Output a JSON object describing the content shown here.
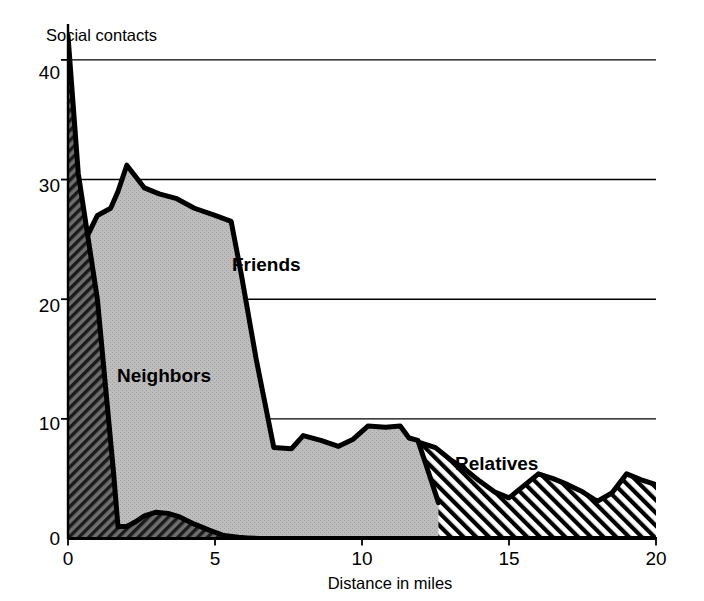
{
  "chart_data": {
    "type": "area",
    "title": "",
    "subtitle": "",
    "xlabel": "Distance in miles",
    "ylabel": "Social contacts",
    "xlim": [
      0,
      20
    ],
    "ylim": [
      0,
      43
    ],
    "xticks": [
      0,
      5,
      10,
      15,
      20
    ],
    "xtick_labels": [
      "0",
      "5",
      "10",
      "15",
      "20"
    ],
    "yticks": [
      0,
      10,
      20,
      30,
      40
    ],
    "ytick_labels": [
      "0",
      "10",
      "20",
      "30",
      "40"
    ],
    "grid": "horizontal",
    "gridlines_at": [
      10,
      20,
      30,
      40
    ],
    "legend": "inline-annotations",
    "stacked": false,
    "overlapping": true,
    "series": [
      {
        "name": "Neighbors",
        "fill": "dense-diagonal-hatch-dark",
        "fill_color": "#555555",
        "label_position": {
          "x": 2.0,
          "y": 15.0
        },
        "x": [
          0,
          0.35,
          1.0,
          1.55,
          1.7,
          2.0,
          2.3,
          2.6,
          3.0,
          3.4,
          3.8,
          4.3,
          4.8,
          5.3,
          5.8,
          6.1,
          6.5,
          7.0,
          20
        ],
        "values": [
          42.0,
          30.5,
          20.0,
          5.5,
          1.0,
          1.0,
          1.4,
          1.9,
          2.2,
          2.1,
          1.8,
          1.2,
          0.7,
          0.25,
          0.1,
          0.05,
          0.0,
          0.0,
          0.0
        ]
      },
      {
        "name": "Friends",
        "fill": "solid-light-gray",
        "fill_color": "#b9b9b9",
        "label_position": {
          "x": 6.0,
          "y": 24.0
        },
        "x": [
          0,
          0.4,
          1.0,
          1.45,
          1.7,
          2.0,
          2.6,
          3.1,
          3.7,
          4.3,
          5.0,
          5.55,
          5.9,
          6.4,
          7.0,
          7.6,
          8.0,
          8.6,
          9.2,
          9.7,
          10.2,
          10.8,
          11.3,
          11.6,
          11.9,
          12.2,
          12.6
        ],
        "values": [
          20.0,
          24.0,
          27.0,
          27.6,
          29.0,
          31.2,
          29.3,
          28.8,
          28.4,
          27.6,
          27.0,
          26.5,
          22.0,
          15.0,
          7.6,
          7.5,
          8.6,
          8.2,
          7.7,
          8.3,
          9.4,
          9.3,
          9.4,
          8.4,
          8.2,
          6.0,
          3.0
        ]
      },
      {
        "name": "Relatives",
        "fill": "diagonal-stripes-white",
        "fill_color": "#ffffff",
        "label_position": {
          "x": 14.6,
          "y": 6.6
        },
        "x": [
          0,
          0.5,
          1.0,
          1.6,
          2.0,
          2.5,
          3.0,
          3.5,
          4.0,
          4.5,
          5.0,
          5.5,
          6.0,
          6.5,
          7.0,
          7.5,
          8.0,
          8.5,
          9.0,
          9.5,
          10.0,
          10.5,
          11.0,
          11.5,
          12.0,
          12.5,
          13.0,
          13.5,
          14.0,
          14.5,
          15.0,
          15.5,
          16.0,
          16.5,
          17.0,
          17.5,
          18.0,
          18.5,
          19.0,
          19.5,
          20.0
        ],
        "values": [
          0.0,
          3.5,
          5.4,
          5.5,
          5.5,
          4.6,
          4.0,
          4.6,
          5.3,
          6.0,
          6.5,
          5.7,
          5.0,
          4.5,
          4.4,
          4.4,
          4.4,
          5.1,
          5.2,
          4.7,
          4.6,
          5.2,
          6.0,
          6.6,
          8.0,
          7.6,
          6.6,
          5.8,
          4.8,
          3.9,
          3.4,
          4.4,
          5.4,
          5.0,
          4.5,
          3.9,
          3.1,
          3.8,
          5.4,
          4.9,
          4.5
        ]
      }
    ]
  },
  "axes": {
    "y_axis_title": "Social contacts",
    "x_axis_title": "Distance in miles"
  },
  "labels": {
    "friends": "Friends",
    "neighbors": "Neighbors",
    "relatives": "Relatives"
  },
  "colors": {
    "axis": "#000000",
    "gridline": "#000000",
    "friends_fill": "#b9b9b9",
    "neighbors_fill": "#555555",
    "relatives_fill": "#ffffff",
    "outline": "#000000",
    "background": "#ffffff"
  }
}
